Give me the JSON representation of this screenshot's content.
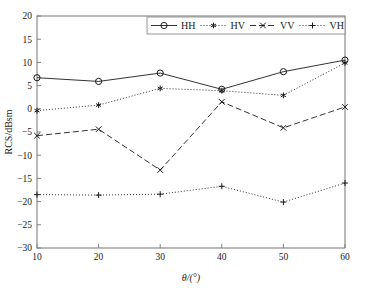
{
  "chart_data": {
    "type": "line",
    "title": "",
    "xlabel": "θ/(°)",
    "ylabel": "RCS/dBsm",
    "x": [
      10,
      20,
      30,
      40,
      50,
      60
    ],
    "xticklabels": [
      "10",
      "20",
      "30",
      "40",
      "50",
      "60"
    ],
    "yticklabels": [
      "20",
      "15",
      "10",
      "5",
      "0",
      "−5",
      "−10",
      "−15",
      "−20",
      "−25",
      "−30"
    ],
    "xlim": [
      10,
      60
    ],
    "ylim": [
      -30,
      20
    ],
    "grid": false,
    "legend_position": "top-center",
    "series": [
      {
        "name": "HH",
        "values": [
          6.7,
          5.9,
          7.7,
          4.2,
          8.0,
          10.5
        ],
        "linestyle": "solid",
        "marker": "circle"
      },
      {
        "name": "HV",
        "values": [
          -0.4,
          0.8,
          4.4,
          3.9,
          2.9,
          9.9
        ],
        "linestyle": "dotted",
        "marker": "asterisk"
      },
      {
        "name": "VV",
        "values": [
          -5.8,
          -4.4,
          -13.2,
          1.5,
          -4.1,
          0.4
        ],
        "linestyle": "dashed",
        "marker": "cross"
      },
      {
        "name": "VH",
        "values": [
          -18.5,
          -18.6,
          -18.4,
          -16.7,
          -20.1,
          -16.0
        ],
        "linestyle": "dotted",
        "marker": "plus"
      }
    ]
  },
  "legend": {
    "entries": [
      {
        "label": "HH"
      },
      {
        "label": "HV"
      },
      {
        "label": "VV"
      },
      {
        "label": "VH"
      }
    ]
  },
  "axes": {
    "x_title": "θ/(°)",
    "y_title": "RCS/dBsm",
    "x_ticks": [
      "10",
      "20",
      "30",
      "40",
      "50",
      "60"
    ],
    "y_ticks": [
      "20",
      "15",
      "10",
      "5",
      "0",
      "−5",
      "−10",
      "−15",
      "−20",
      "−25",
      "−30"
    ]
  },
  "colors": {
    "axis": "#808080",
    "series": "#333333",
    "text": "#1a1a1a",
    "background": "#ffffff"
  }
}
